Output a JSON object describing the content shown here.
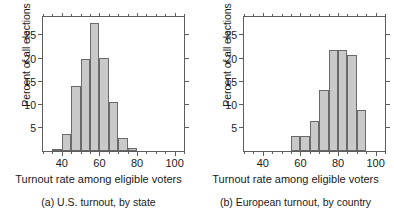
{
  "figure": {
    "background": "#ffffff",
    "bar_fill": "#c9c9c9",
    "bar_edge": "#6a6a6a",
    "axis_color": "#5d5d5d"
  },
  "chart_data": [
    {
      "type": "bar",
      "title": "",
      "caption": "(a) U.S. turnout, by state",
      "xlabel": "Turnout rate among eligible voters",
      "ylabel": "Percent of all elections",
      "xlim": [
        30,
        105
      ],
      "ylim": [
        0,
        29
      ],
      "grid": false,
      "legend": "none",
      "bin_width": 5,
      "xticks": [
        40,
        60,
        80,
        100
      ],
      "xticks_minor": [
        30,
        35,
        45,
        50,
        55,
        65,
        70,
        75,
        85,
        90,
        95,
        105
      ],
      "xtick_labels": [
        "40",
        "60",
        "80",
        "100"
      ],
      "yticks": [
        5,
        10,
        15,
        20,
        25
      ],
      "ytick_labels": [
        "5",
        "10",
        "15",
        "20",
        "25"
      ],
      "categories": [
        "30-35",
        "35-40",
        "40-45",
        "45-50",
        "50-55",
        "55-60",
        "60-65",
        "65-70",
        "70-75",
        "75-80",
        "80-85"
      ],
      "bin_starts": [
        30,
        35,
        40,
        45,
        50,
        55,
        60,
        65,
        70,
        75,
        80
      ],
      "values": [
        0,
        0.4,
        3.6,
        14.1,
        19.9,
        27.8,
        20.2,
        10.5,
        2.9,
        0.6,
        0
      ]
    },
    {
      "type": "bar",
      "title": "",
      "caption": "(b) European turnout, by country",
      "xlabel": "Turnout rate among eligible voters",
      "ylabel": "Percent of all elections",
      "xlim": [
        30,
        105
      ],
      "ylim": [
        0,
        29
      ],
      "grid": false,
      "legend": "none",
      "bin_width": 5,
      "xticks": [
        40,
        60,
        80,
        100
      ],
      "xticks_minor": [
        30,
        35,
        45,
        50,
        55,
        65,
        70,
        75,
        85,
        90,
        95,
        105
      ],
      "xtick_labels": [
        "40",
        "60",
        "80",
        "100"
      ],
      "yticks": [
        5,
        10,
        15,
        20,
        25
      ],
      "ytick_labels": [
        "5",
        "10",
        "15",
        "20",
        "25"
      ],
      "categories": [
        "30-35",
        "35-40",
        "40-45",
        "45-50",
        "50-55",
        "55-60",
        "60-65",
        "65-70",
        "70-75",
        "75-80",
        "80-85",
        "85-90",
        "90-95"
      ],
      "bin_starts": [
        30,
        35,
        40,
        45,
        50,
        55,
        60,
        65,
        70,
        75,
        80,
        85,
        90
      ],
      "values": [
        0,
        0,
        0,
        0,
        0,
        3.3,
        3.3,
        6.6,
        13.2,
        21.9,
        21.9,
        20.7,
        8.8
      ]
    }
  ]
}
